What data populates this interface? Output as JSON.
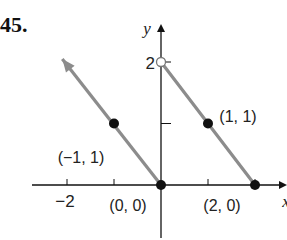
{
  "problem_number": "45.",
  "chart_data": {
    "type": "line",
    "title": "",
    "xlabel": "x",
    "ylabel": "y",
    "xlim": [
      -3,
      2.6
    ],
    "ylim": [
      -1,
      2.5
    ],
    "grid": false,
    "x_ticks": [
      -2,
      -1,
      1,
      2
    ],
    "x_tick_labels": [
      {
        "value": -2,
        "label": "−2"
      }
    ],
    "y_ticks": [
      1,
      2
    ],
    "y_tick_labels": [
      {
        "value": 2,
        "label": "2"
      }
    ],
    "series": [
      {
        "name": "left piece (y = -x, x <= 0)",
        "points": [
          [
            -1.0,
            1.0
          ],
          [
            0,
            0
          ]
        ],
        "extends_with_arrow_to": [
          -2.1,
          2.05
        ],
        "color": "#8c8c8c"
      },
      {
        "name": "right piece (y = 2 - x, 0 < x <= 2)",
        "points": [
          [
            0,
            2
          ],
          [
            1,
            1
          ],
          [
            2,
            0
          ]
        ],
        "color": "#8c8c8c"
      }
    ],
    "marked_points": [
      {
        "x": -1,
        "y": 1,
        "label": "(−1, 1)",
        "style": "filled"
      },
      {
        "x": 0,
        "y": 0,
        "label": "(0, 0)",
        "style": "filled"
      },
      {
        "x": 1,
        "y": 1,
        "label": "(1, 1)",
        "style": "filled"
      },
      {
        "x": 2,
        "y": 0,
        "label": "(2, 0)",
        "style": "filled"
      },
      {
        "x": 0,
        "y": 2,
        "label": "",
        "style": "open"
      }
    ]
  }
}
